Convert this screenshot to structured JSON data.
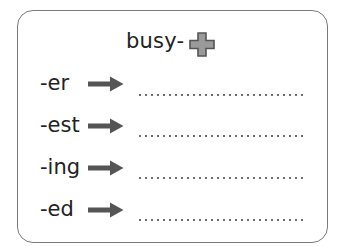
{
  "worksheet": {
    "base_word": "busy-",
    "plus_icon": "plus-icon",
    "colors": {
      "border": "#7a7a7a",
      "text": "#222222",
      "arrow": "#555555",
      "plus_fill": "#9a9a9a",
      "plus_outline": "#555555",
      "dots": "#6e6e6e"
    },
    "rows": [
      {
        "suffix": "-er",
        "arrow_icon": "right-arrow-icon",
        "answer": ""
      },
      {
        "suffix": "-est",
        "arrow_icon": "right-arrow-icon",
        "answer": ""
      },
      {
        "suffix": "-ing",
        "arrow_icon": "right-arrow-icon",
        "answer": ""
      },
      {
        "suffix": "-ed",
        "arrow_icon": "right-arrow-icon",
        "answer": ""
      }
    ]
  }
}
